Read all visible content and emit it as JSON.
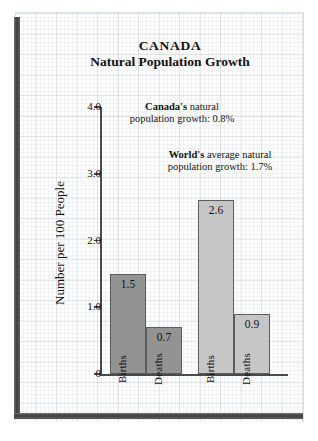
{
  "figure": {
    "title_main": "CANADA",
    "title_sub": "Natural Population Growth"
  },
  "annotations": {
    "canada": {
      "emphasis": "Canada's",
      "rest": " natural\npopulation growth:  0.8%",
      "full": "Canada's natural population growth: 0.8%"
    },
    "world": {
      "emphasis": "World's",
      "rest": " average natural\npopulation growth:  1.7%",
      "full": "World's average natural population growth: 1.7%"
    }
  },
  "axis": {
    "y_title": "Number per 100 People",
    "y_ticks": [
      "4.0",
      "3.0",
      "2.0",
      "1.0",
      "0"
    ]
  },
  "chart_data": {
    "type": "bar",
    "xlabel": "",
    "ylabel": "Number per 100 People",
    "ylim": [
      0,
      4.0
    ],
    "yticks": [
      0,
      1.0,
      2.0,
      3.0,
      4.0
    ],
    "grid": true,
    "legend": "none",
    "groups": [
      {
        "name": "Canada",
        "shade": "dark",
        "color": "#939393",
        "bars": [
          {
            "label": "Births",
            "value": 1.5,
            "value_label": "1.5"
          },
          {
            "label": "Deaths",
            "value": 0.7,
            "value_label": "0.7"
          }
        ]
      },
      {
        "name": "World",
        "shade": "light",
        "color": "#c6c6c6",
        "bars": [
          {
            "label": "Births",
            "value": 2.6,
            "value_label": "2.6"
          },
          {
            "label": "Deaths",
            "value": 0.9,
            "value_label": "0.9"
          }
        ]
      }
    ],
    "categories": [
      "Canada Births",
      "Canada Deaths",
      "World Births",
      "World Deaths"
    ],
    "values": [
      1.5,
      0.7,
      2.6,
      0.9
    ],
    "annotations": [
      "Canada's natural population growth: 0.8%",
      "World's average natural population growth: 1.7%"
    ]
  },
  "colors": {
    "bar_dark": "#939393",
    "bar_light": "#c6c6c6",
    "axis": "#4a4a4a",
    "frame": "#3f3f3f",
    "text": "#121212"
  }
}
